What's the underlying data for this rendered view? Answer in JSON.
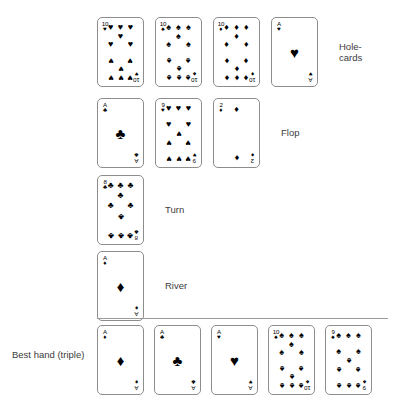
{
  "diagram": {
    "background_color": "#ffffff",
    "card_border_color": "#8d8d8d",
    "pip_color": "#000000",
    "label_color": "#3b3b3b",
    "separator_color": "#9a9a9a"
  },
  "suit_glyphs": {
    "hearts": "♥",
    "spades": "♠",
    "diamonds": "♦",
    "clubs": "♣"
  },
  "rows": [
    {
      "id": "holecards",
      "label": "Hole-\ncards",
      "label_position": "right",
      "cards": [
        {
          "rank": "10",
          "suit": "hearts",
          "suit_glyph": "♥",
          "name": "ten-of-hearts"
        },
        {
          "rank": "10",
          "suit": "spades",
          "suit_glyph": "♠",
          "name": "ten-of-spades"
        },
        {
          "rank": "10",
          "suit": "diamonds",
          "suit_glyph": "♦",
          "name": "ten-of-diamonds"
        },
        {
          "rank": "A",
          "suit": "hearts",
          "suit_glyph": "♥",
          "name": "ace-of-hearts"
        }
      ]
    },
    {
      "id": "flop",
      "label": "Flop",
      "label_position": "right",
      "cards": [
        {
          "rank": "A",
          "suit": "clubs",
          "suit_glyph": "♣",
          "name": "ace-of-clubs"
        },
        {
          "rank": "9",
          "suit": "hearts",
          "suit_glyph": "♥",
          "name": "nine-of-hearts"
        },
        {
          "rank": "2",
          "suit": "diamonds",
          "suit_glyph": "♦",
          "name": "two-of-diamonds"
        }
      ]
    },
    {
      "id": "turn",
      "label": "Turn",
      "label_position": "right",
      "cards": [
        {
          "rank": "8",
          "suit": "clubs",
          "suit_glyph": "♣",
          "name": "eight-of-clubs"
        }
      ]
    },
    {
      "id": "river",
      "label": "River",
      "label_position": "right",
      "cards": [
        {
          "rank": "A",
          "suit": "diamonds",
          "suit_glyph": "♦",
          "name": "ace-of-diamonds"
        }
      ]
    },
    {
      "id": "best-hand",
      "label": "Best hand (triple)",
      "label_position": "left",
      "cards": [
        {
          "rank": "A",
          "suit": "diamonds",
          "suit_glyph": "♦",
          "name": "ace-of-diamonds"
        },
        {
          "rank": "A",
          "suit": "clubs",
          "suit_glyph": "♣",
          "name": "ace-of-clubs"
        },
        {
          "rank": "A",
          "suit": "hearts",
          "suit_glyph": "♥",
          "name": "ace-of-hearts"
        },
        {
          "rank": "10",
          "suit": "spades",
          "suit_glyph": "♠",
          "name": "ten-of-spades"
        },
        {
          "rank": "9",
          "suit": "spades",
          "suit_glyph": "♠",
          "name": "nine-of-spades"
        }
      ]
    }
  ]
}
